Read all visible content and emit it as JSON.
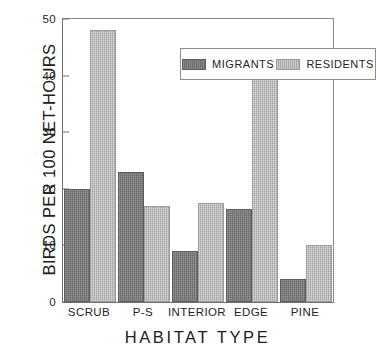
{
  "chart_data": {
    "type": "bar",
    "title": "",
    "xlabel": "HABITAT TYPE",
    "ylabel": "BIRDS PER 100 NET-HOURS",
    "categories": [
      "SCRUB",
      "P-S",
      "INTERIOR",
      "EDGE",
      "PINE"
    ],
    "series": [
      {
        "name": "MIGRANTS",
        "values": [
          20,
          23,
          9,
          16.5,
          4
        ],
        "color": "#757575"
      },
      {
        "name": "RESIDENTS",
        "values": [
          48,
          17,
          17.5,
          40,
          10
        ],
        "color": "#b3b3b3"
      }
    ],
    "ylim": [
      0,
      50
    ],
    "yticks": [
      0,
      10,
      20,
      30,
      40,
      50
    ],
    "grid": false,
    "legend_position": "top-center",
    "legend_entries": [
      "MIGRANTS",
      "RESIDENTS"
    ]
  },
  "legend": {
    "migrants_label": "MIGRANTS",
    "residents_label": "RESIDENTS"
  },
  "axes": {
    "x_title": "HABITAT TYPE",
    "y_title": "BIRDS PER 100 NET-HOURS"
  }
}
